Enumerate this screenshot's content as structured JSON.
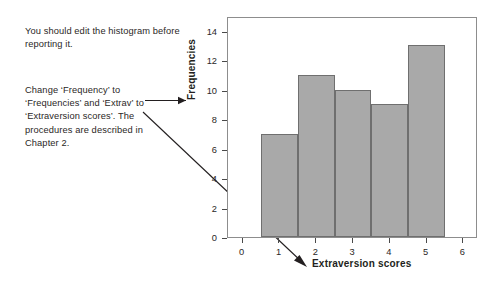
{
  "annotations": {
    "note_1": "You should edit the histogram before reporting it.",
    "note_2": "Change ‘Frequency’ to ‘Frequencies’ and ‘Extrav’ to ‘Extraversion scores’. The procedures are described in Chapter 2.",
    "arrow_to_ylabel": "arrow-right",
    "arrow_to_xlabel": "arrow-diagonal-down-right"
  },
  "chart_data": {
    "type": "bar",
    "title": "",
    "xlabel": "Extraversion scores",
    "ylabel": "Frequencies",
    "categories": [
      "1",
      "2",
      "3",
      "4",
      "5"
    ],
    "values": [
      7,
      11,
      10,
      9,
      13
    ],
    "bar_edges": [
      0.5,
      1.5,
      2.5,
      3.5,
      4.5,
      5.5
    ],
    "xlim": [
      -0.4,
      6.4
    ],
    "ylim": [
      0,
      15
    ],
    "xticks": [
      0,
      1,
      2,
      3,
      4,
      5,
      6
    ],
    "xtick_labels": [
      "0",
      "1",
      "2",
      "3",
      "4",
      "5",
      "6"
    ],
    "yticks": [
      0,
      2,
      4,
      6,
      8,
      10,
      12,
      14
    ],
    "ytick_labels": [
      "0",
      "2",
      "4",
      "6",
      "8",
      "10",
      "12",
      "14"
    ],
    "grid": false,
    "legend": null,
    "bar_color": "#a9a9a9",
    "bar_edge_color": "#6f6f6f",
    "frame_color": "#8d8d8d"
  }
}
